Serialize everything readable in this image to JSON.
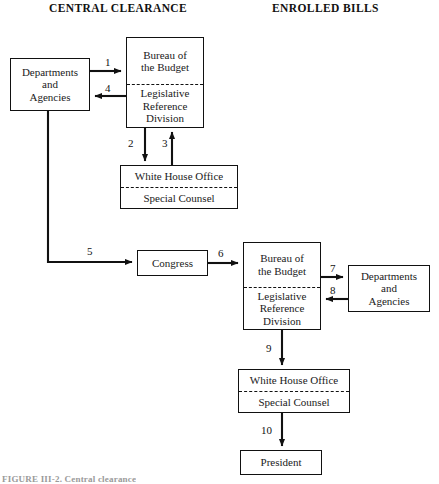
{
  "headings": {
    "left": "CENTRAL CLEARANCE",
    "right": "ENROLLED BILLS"
  },
  "boxes": {
    "dept_top": {
      "lines": [
        "Departments",
        "and",
        "Agencies"
      ]
    },
    "bob_top": {
      "upper": [
        "Bureau of",
        "the Budget"
      ],
      "lower": [
        "Legislative",
        "Reference",
        "Division"
      ]
    },
    "wh_top": {
      "upper": "White House Office",
      "lower": "Special Counsel"
    },
    "congress": {
      "label": "Congress"
    },
    "bob_bottom": {
      "upper": [
        "Bureau of",
        "the Budget"
      ],
      "lower": [
        "Legislative",
        "Reference",
        "Division"
      ]
    },
    "dept_right": {
      "lines": [
        "Departments",
        "and",
        "Agencies"
      ]
    },
    "wh_bottom": {
      "upper": "White House Office",
      "lower": "Special Counsel"
    },
    "president": {
      "label": "President"
    }
  },
  "steps": {
    "s1": "1",
    "s2": "2",
    "s3": "3",
    "s4": "4",
    "s5": "5",
    "s6": "6",
    "s7": "7",
    "s8": "8",
    "s9": "9",
    "s10": "10"
  },
  "caption": "FIGURE III-2.  Central clearance",
  "colors": {
    "line": "#111111",
    "background": "#ffffff",
    "text": "#1a1a1a"
  }
}
